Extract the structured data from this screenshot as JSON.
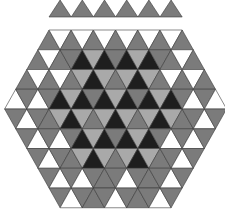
{
  "title": "Triangular tiling hexagon puzzle",
  "palette": {
    "W": "#ffffff",
    "L": "#a9a9a9",
    "M": "#7b7b7b",
    "D": "#1e1e1e"
  },
  "geometry": {
    "side": 22.2,
    "row_height": 19.75,
    "strip": {
      "x0": 49,
      "y0": 0,
      "height": 17,
      "count": 6
    },
    "hex": {
      "top_y": 30,
      "top_left_x": 49,
      "top_sides": 6,
      "expand_rows": 4,
      "contract_rows": 5
    }
  },
  "top_strip": {
    "colors": [
      "M",
      "M",
      "M",
      "M",
      "M",
      "M"
    ]
  },
  "hexagon_rows": [
    {
      "row": 0,
      "first": "up",
      "colors": [
        "M",
        "W",
        "M",
        "W",
        "M",
        "W",
        "M",
        "W",
        "M",
        "W",
        "M",
        "W",
        "M"
      ]
    },
    {
      "row": 1,
      "first": "up",
      "colors": [
        "M",
        "W",
        "M",
        "M",
        "D",
        "L",
        "D",
        "M",
        "D",
        "L",
        "D",
        "M",
        "M",
        "W",
        "M"
      ]
    },
    {
      "row": 2,
      "first": "up",
      "colors": [
        "M",
        "W",
        "M",
        "W",
        "M",
        "L",
        "D",
        "L",
        "M",
        "L",
        "D",
        "L",
        "M",
        "W",
        "M",
        "W",
        "M"
      ]
    },
    {
      "row": 3,
      "first": "up",
      "colors": [
        "W",
        "M",
        "W",
        "M",
        "D",
        "L",
        "D",
        "M",
        "D",
        "L",
        "D",
        "M",
        "D",
        "L",
        "D",
        "M",
        "W",
        "M",
        "W"
      ]
    },
    {
      "row": 4,
      "first": "down",
      "colors": [
        "M",
        "W",
        "M",
        "M",
        "L",
        "D",
        "L",
        "M",
        "L",
        "D",
        "L",
        "M",
        "L",
        "D",
        "L",
        "M",
        "M",
        "W",
        "M"
      ]
    },
    {
      "row": 5,
      "first": "down",
      "colors": [
        "M",
        "W",
        "M",
        "W",
        "M",
        "D",
        "L",
        "D",
        "M",
        "D",
        "L",
        "D",
        "M",
        "W",
        "M",
        "W",
        "M"
      ]
    },
    {
      "row": 6,
      "first": "down",
      "colors": [
        "M",
        "W",
        "M",
        "M",
        "L",
        "D",
        "L",
        "M",
        "L",
        "D",
        "L",
        "M",
        "M",
        "W",
        "M"
      ]
    },
    {
      "row": 7,
      "first": "down",
      "colors": [
        "M",
        "W",
        "M",
        "W",
        "M",
        "M",
        "M",
        "W",
        "M",
        "M",
        "M",
        "W",
        "M"
      ]
    },
    {
      "row": 8,
      "first": "down",
      "colors": [
        "M",
        "W",
        "M",
        "M",
        "M",
        "W",
        "M",
        "M",
        "M",
        "W",
        "M"
      ]
    }
  ]
}
